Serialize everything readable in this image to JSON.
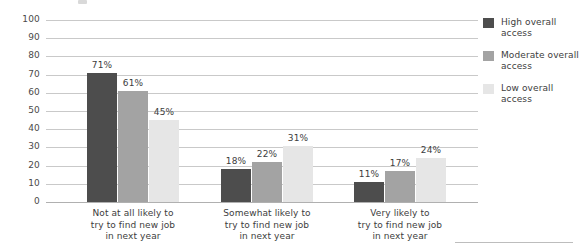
{
  "chart_data": {
    "type": "bar",
    "title": "",
    "subtitle": "",
    "xlabel": "",
    "ylabel": "Percentage",
    "ylim": [
      0,
      100
    ],
    "ytick_step": 10,
    "yticks": [
      "100",
      "90",
      "80",
      "70",
      "60",
      "50",
      "40",
      "30",
      "20",
      "10",
      "0"
    ],
    "grid": "horizontal",
    "legend_position": "right",
    "value_suffix": "%",
    "categories": [
      "Not at all likely to\ntry to find new job\nin next year",
      "Somewhat likely to\ntry to find new job\nin next year",
      "Very likely to\ntry to find new job\nin next year"
    ],
    "series": [
      {
        "name": "High overall access",
        "color": "#4d4d4d",
        "values": [
          71,
          61,
          45
        ],
        "labels": [
          "71%",
          "61%",
          "45%"
        ]
      },
      {
        "name": "Moderate overall access",
        "color": "#a3a3a3",
        "values": [
          18,
          22,
          31
        ],
        "labels": [
          "18%",
          "22%",
          "31%"
        ]
      },
      {
        "name": "Low overall access",
        "color": "#e6e6e6",
        "values": [
          11,
          17,
          24
        ],
        "labels": [
          "11%",
          "17%",
          "24%"
        ]
      }
    ],
    "groups": [
      {
        "category": "Not at all likely to try to find new job in next year",
        "lines": [
          "Not at all likely to",
          "try to find new job",
          "in next year"
        ],
        "bars": [
          {
            "series": "High overall access",
            "value": 71,
            "label": "71%"
          },
          {
            "series": "Moderate overall access",
            "value": 61,
            "label": "61%"
          },
          {
            "series": "Low overall access",
            "value": 45,
            "label": "45%"
          }
        ]
      },
      {
        "category": "Somewhat likely to try to find new job in next year",
        "lines": [
          "Somewhat likely to",
          "try to find new job",
          "in next year"
        ],
        "bars": [
          {
            "series": "High overall access",
            "value": 18,
            "label": "18%"
          },
          {
            "series": "Moderate overall access",
            "value": 22,
            "label": "22%"
          },
          {
            "series": "Low overall access",
            "value": 31,
            "label": "31%"
          }
        ]
      },
      {
        "category": "Very likely to try to find new job in next year",
        "lines": [
          "Very likely to",
          "try to find new job",
          "in next year"
        ],
        "bars": [
          {
            "series": "High overall access",
            "value": 11,
            "label": "11%"
          },
          {
            "series": "Moderate overall access",
            "value": 17,
            "label": "17%"
          },
          {
            "series": "Low overall access",
            "value": 24,
            "label": "24%"
          }
        ]
      }
    ]
  },
  "legend": {
    "items": [
      {
        "label_line1": "High overall",
        "label_line2": "access",
        "color": "#4d4d4d"
      },
      {
        "label_line1": "Moderate overall",
        "label_line2": "access",
        "color": "#a3a3a3"
      },
      {
        "label_line1": "Low overall",
        "label_line2": "access",
        "color": "#e6e6e6"
      }
    ]
  },
  "colors": {
    "gridline": "#c9c9c9",
    "axis": "#b0b0b0",
    "text": "#3d3d3d",
    "background": "#ffffff"
  }
}
